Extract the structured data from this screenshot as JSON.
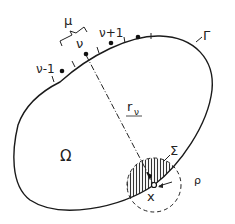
{
  "diagram": {
    "colors": {
      "stroke": "#1a1a1a",
      "background": "#ffffff",
      "hatch": "#333333"
    },
    "labels": {
      "region": "Ω",
      "boundary": "Γ",
      "node_prev": "ν-1",
      "node_curr": "ν",
      "node_next": "ν+1",
      "bracket": "μ",
      "distance": "r",
      "distance_sub": "ν",
      "hatched_region": "Σ",
      "point": "x",
      "radius": "ρ"
    },
    "elements": [
      "boundary-curve",
      "boundary-nodes",
      "tick-marks",
      "mu-bracket",
      "distance-line-dashdot",
      "hatched-sigma-region",
      "dashed-circle-rho",
      "point-x"
    ]
  }
}
